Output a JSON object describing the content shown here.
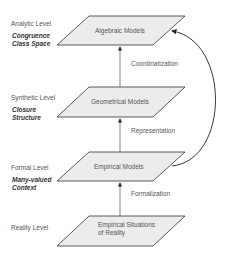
{
  "levels": [
    {
      "label": "Analytic Level",
      "sub": "Congruence Class Space",
      "model": "Algebraic Models"
    },
    {
      "label": "Synthetic Level",
      "sub": "Closure Structure",
      "model": "Geometrical Models"
    },
    {
      "label": "Formal Level",
      "sub": "Many-valued Context",
      "model": "Empirical Models"
    },
    {
      "label": "Reality Level",
      "sub": "",
      "model": "Empirical Situations of Reality"
    }
  ],
  "edges": [
    {
      "from": "Empirical Situations of Reality",
      "to": "Empirical Models",
      "label": "Formalization"
    },
    {
      "from": "Empirical Models",
      "to": "Geometrical Models",
      "label": "Representation"
    },
    {
      "from": "Geometrical Models",
      "to": "Algebraic Models",
      "label": "Coordinatization"
    },
    {
      "from": "Empirical Models",
      "to": "Algebraic Models",
      "label": ""
    }
  ],
  "colors": {
    "shape_fill": "#ececec",
    "stroke": "#333333",
    "text": "#555555"
  }
}
